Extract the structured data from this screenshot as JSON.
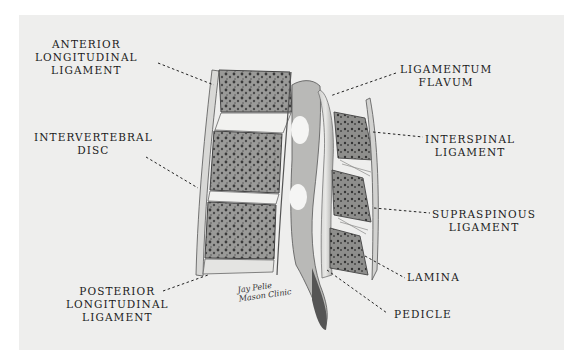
{
  "figure": {
    "type": "anatomical-illustration",
    "background_color": "#eeeeed",
    "signature": [
      "Jay Pelie",
      "Mason Clinic"
    ]
  },
  "labels": {
    "anterior_longitudinal_ligament": [
      "ANTERIOR",
      "LONGITUDINAL",
      "LIGAMENT"
    ],
    "intervertebral_disc": [
      "INTERVERTEBRAL",
      "DISC"
    ],
    "posterior_longitudinal_ligament": [
      "POSTERIOR",
      "LONGITUDINAL",
      "LIGAMENT"
    ],
    "ligamentum_flavum": [
      "LIGAMENTUM",
      "FLAVUM"
    ],
    "interspinal_ligament": [
      "INTERSPINAL",
      "LIGAMENT"
    ],
    "supraspinous_ligament": [
      "SUPRASPINOUS",
      "LIGAMENT"
    ],
    "lamina": [
      "LAMINA"
    ],
    "pedicle": [
      "PEDICLE"
    ]
  }
}
